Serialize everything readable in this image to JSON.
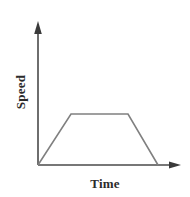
{
  "figure": {
    "name": "speed-time-graph",
    "width": 190,
    "height": 197,
    "background": "#ffffff"
  },
  "axes": {
    "y_label": "Speed",
    "x_label": "Time",
    "axis_color": "#4a4a4a",
    "axis_line_width": 1.6,
    "origin": {
      "x": 38,
      "y": 165
    },
    "y_axis_top": {
      "x": 38,
      "y": 22
    },
    "x_axis_right": {
      "x": 181,
      "y": 165
    },
    "y_arrowhead": true,
    "x_arrowhead": true,
    "ticks": [],
    "tick_labels": [],
    "grid": false
  },
  "chart_data": {
    "type": "line",
    "title": "",
    "subtitle": "",
    "xlabel": "Time",
    "ylabel": "Speed",
    "xlim": [
      0,
      1
    ],
    "ylim": [
      0,
      1
    ],
    "grid": false,
    "legend": null,
    "axis_ticks_shown": false,
    "series": [
      {
        "name": "speed",
        "color": "#808080",
        "line_width": 1.6,
        "shape": "trapezoid",
        "description": "Speed increases linearly from rest, holds constant, then decreases linearly back to rest.",
        "points_px": [
          {
            "x": 38,
            "y": 165
          },
          {
            "x": 71,
            "y": 114
          },
          {
            "x": 128,
            "y": 114
          },
          {
            "x": 158,
            "y": 165
          }
        ],
        "x": [
          0.0,
          0.231,
          0.629,
          0.839
        ],
        "values": [
          0.0,
          1.0,
          1.0,
          0.0
        ]
      }
    ],
    "annotations": []
  },
  "colors": {
    "background": "#ffffff",
    "axis": "#4a4a4a",
    "curve": "#808080",
    "label_text": "#2b2b2b"
  }
}
